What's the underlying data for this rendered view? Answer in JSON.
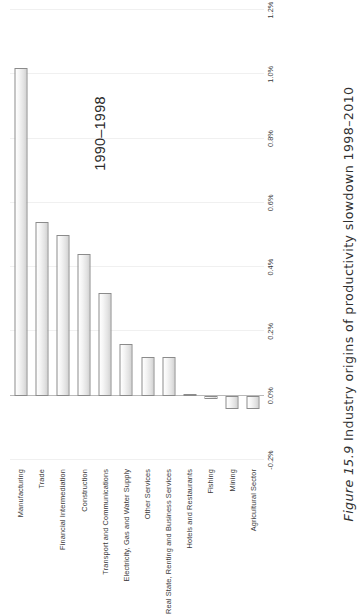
{
  "figure": {
    "caption_label": "Figure 15.9",
    "caption_text": "Industry origins of productivity slowdown 1998–2010"
  },
  "chart_data": {
    "type": "bar",
    "orientation": "horizontal",
    "title": "",
    "subtitle": "",
    "annotation": "1990–1998",
    "xlabel": "",
    "ylabel": "",
    "xlim": [
      -0.2,
      1.2
    ],
    "xticks": [
      "-0.2%",
      "0.0%",
      "0.2%",
      "0.4%",
      "0.6%",
      "0.8%",
      "1.0%",
      "1.2%"
    ],
    "xtick_values": [
      -0.2,
      0.0,
      0.2,
      0.4,
      0.6,
      0.8,
      1.0,
      1.2
    ],
    "grid": true,
    "legend": "none",
    "categories": [
      "Manufacturing",
      "Trade",
      "Financial Intermediation",
      "Construction",
      "Transport and Communications",
      "Electricity, Gas and Water Supply",
      "Other Services",
      "Real State, Renting and Business Services",
      "Hotels and Restaurants",
      "Fishing",
      "Mining",
      "Agricultural Sector"
    ],
    "series": [
      {
        "name": "1990–1998",
        "values": [
          1.02,
          0.54,
          0.5,
          0.44,
          0.32,
          0.16,
          0.12,
          0.12,
          0.005,
          -0.01,
          -0.04,
          -0.04
        ]
      }
    ],
    "bar_color": "#ededed",
    "bar_edge_color": "#8b8b8b"
  }
}
